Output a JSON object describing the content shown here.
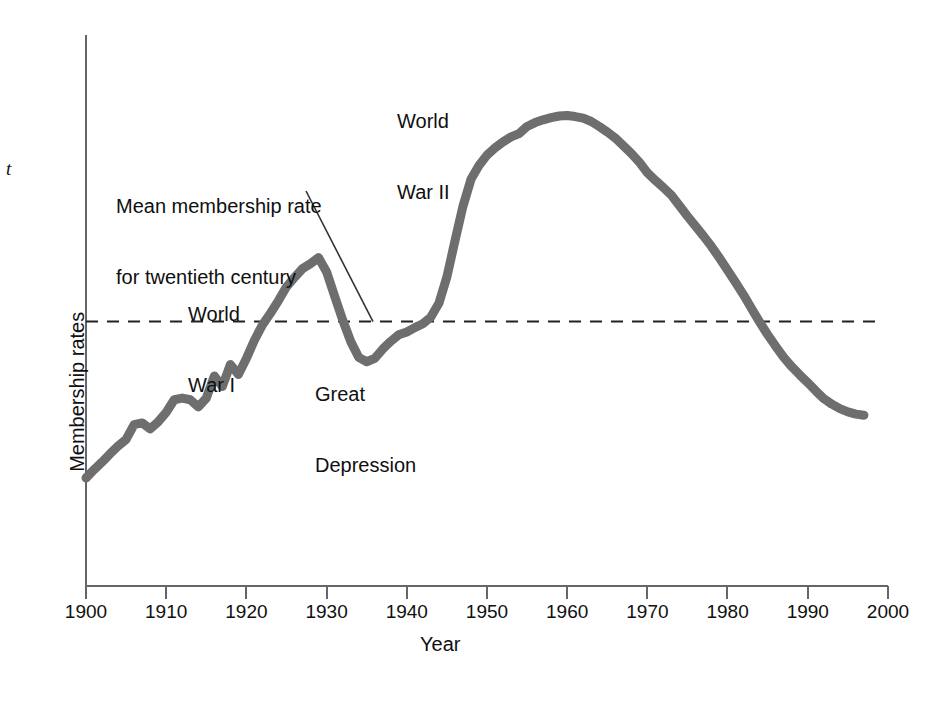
{
  "figure": {
    "side_text_fragment": "t",
    "background_color": "#ffffff"
  },
  "chart_data": {
    "type": "line",
    "title": "",
    "xlabel": "Year",
    "ylabel": "Membership rates",
    "xlim": [
      1900,
      2000
    ],
    "ylim": [
      0,
      100
    ],
    "grid": false,
    "legend": null,
    "line_color": "#6e6e6e",
    "line_width_px": 9,
    "axis_color": "#555555",
    "xticks": [
      1900,
      1910,
      1920,
      1930,
      1940,
      1950,
      1960,
      1970,
      1980,
      1990,
      2000
    ],
    "xtick_labels": [
      "1900",
      "1910",
      "1920",
      "1930",
      "1940",
      "1950",
      "1960",
      "1970",
      "1980",
      "1990",
      "2000"
    ],
    "yticks": [],
    "ytick_labels": [],
    "reference_line": {
      "label": "Mean membership rate for twentieth century",
      "label_line_1": "Mean membership rate",
      "label_line_2": "for twentieth century",
      "value": 48,
      "style": "dashed",
      "color": "#222222"
    },
    "annotations": [
      {
        "id": "world-war-1",
        "text": "World War I",
        "line_1": "World",
        "line_2": "War I",
        "x": 1913,
        "y": 62
      },
      {
        "id": "great-depression",
        "text": "Great Depression",
        "line_1": "Great",
        "line_2": "Depression",
        "x": 1929,
        "y": 28
      },
      {
        "id": "world-war-2",
        "text": "World War II",
        "line_1": "World",
        "line_2": "War II",
        "x": 1939,
        "y": 90
      }
    ],
    "x": [
      1900,
      1901,
      1902,
      1903,
      1904,
      1905,
      1906,
      1907,
      1908,
      1909,
      1910,
      1911,
      1912,
      1913,
      1914,
      1915,
      1916,
      1917,
      1918,
      1919,
      1920,
      1921,
      1922,
      1923,
      1924,
      1925,
      1926,
      1927,
      1928,
      1929,
      1930,
      1931,
      1932,
      1933,
      1934,
      1935,
      1936,
      1937,
      1938,
      1939,
      1940,
      1941,
      1942,
      1943,
      1944,
      1945,
      1946,
      1947,
      1948,
      1949,
      1950,
      1951,
      1952,
      1953,
      1954,
      1955,
      1956,
      1957,
      1958,
      1959,
      1960,
      1961,
      1962,
      1963,
      1964,
      1965,
      1966,
      1967,
      1968,
      1969,
      1970,
      1971,
      1972,
      1973,
      1974,
      1975,
      1976,
      1977,
      1978,
      1979,
      1980,
      1981,
      1982,
      1983,
      1984,
      1985,
      1986,
      1987,
      1988,
      1989,
      1990,
      1991,
      1992,
      1993,
      1994,
      1995,
      1996,
      1997
    ],
    "y": [
      19.6,
      21.1,
      22.5,
      24.0,
      25.4,
      26.6,
      29.3,
      29.6,
      28.5,
      29.8,
      31.5,
      33.8,
      34.1,
      33.8,
      32.5,
      34.1,
      38.1,
      36.2,
      40.2,
      38.4,
      41.3,
      44.6,
      47.4,
      49.5,
      51.8,
      54.3,
      56.0,
      57.6,
      58.5,
      59.6,
      57.0,
      52.6,
      48.3,
      44.4,
      41.5,
      40.7,
      41.3,
      43.0,
      44.4,
      45.6,
      46.1,
      46.9,
      47.6,
      48.8,
      51.3,
      56.1,
      62.6,
      68.9,
      73.8,
      76.3,
      78.2,
      79.5,
      80.6,
      81.5,
      82.1,
      83.4,
      84.1,
      84.6,
      85.0,
      85.3,
      85.4,
      85.2,
      84.9,
      84.3,
      83.4,
      82.4,
      81.3,
      79.9,
      78.5,
      76.9,
      75.0,
      73.6,
      72.3,
      70.9,
      69.0,
      67.1,
      65.3,
      63.5,
      61.6,
      59.5,
      57.3,
      55.1,
      52.8,
      50.3,
      47.9,
      45.6,
      43.5,
      41.5,
      39.8,
      38.3,
      36.9,
      35.4,
      34.0,
      33.0,
      32.2,
      31.6,
      31.2,
      31.0
    ]
  },
  "axis_title_x": "Year",
  "axis_title_y": "Membership rates"
}
